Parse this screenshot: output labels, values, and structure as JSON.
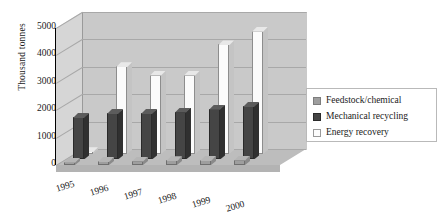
{
  "chart_data": {
    "type": "bar",
    "title": "",
    "subtitle": "",
    "xlabel": "",
    "ylabel": "Thousand tonnes",
    "categories": [
      "1995",
      "1996",
      "1997",
      "1998",
      "1999",
      "2000"
    ],
    "series": [
      {
        "name": "Feedstock/chemical",
        "values": [
          120,
          150,
          160,
          170,
          180,
          200
        ]
      },
      {
        "name": "Mechanical recycling",
        "values": [
          1550,
          1700,
          1700,
          1750,
          1850,
          1950
        ]
      },
      {
        "name": "Energy recovery",
        "values": [
          100,
          3200,
          2900,
          2900,
          4000,
          4500
        ]
      }
    ],
    "ylim": [
      0,
      5000
    ],
    "yticks": [
      0,
      1000,
      2000,
      3000,
      4000,
      5000
    ],
    "ytick_labels": [
      "0",
      "1000",
      "2000",
      "3000",
      "4000",
      "5000"
    ],
    "grid": true,
    "legend_position": "right",
    "projection": "3d",
    "colors": {
      "feedstock": "#9e9e9e",
      "mechanical": "#454545",
      "energy": "#fbfbfb",
      "back_wall": "#c9c9c9",
      "left_wall": "#d6d6d6",
      "floor": "#bdbdbd",
      "gridline": "#a8a8a8",
      "text": "#1a1a1a"
    }
  },
  "legend": {
    "items": [
      {
        "label": "Feedstock/chemical",
        "swatch": "feedstock-swatch"
      },
      {
        "label": "Mechanical recycling",
        "swatch": "mechanical-swatch"
      },
      {
        "label": "Energy recovery",
        "swatch": "energy-swatch"
      }
    ]
  }
}
